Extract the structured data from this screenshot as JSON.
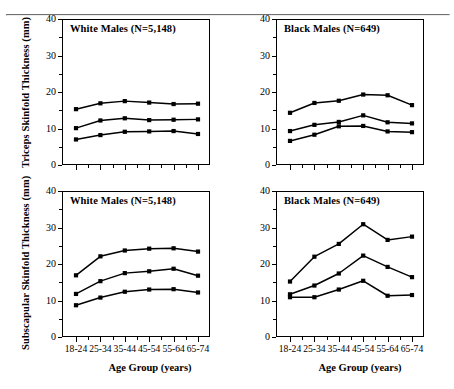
{
  "figure": {
    "xlabel": "Age Group (years)",
    "ylabel_top": "Triceps Skinfold Thickness (mm)",
    "ylabel_bottom": "Subscapular Skinfold Thickness (mm)",
    "panel_titles": {
      "white_males": "White Males (N=5,148)",
      "black_males": "Black Males (N=649)"
    },
    "ytick_labels": [
      "0",
      "10",
      "20",
      "30",
      "40"
    ],
    "xtick_labels": [
      "18-24",
      "25-34",
      "35-44",
      "45-54",
      "55-64",
      "65-74"
    ],
    "line_color": "#000000",
    "marker": "filled-square"
  },
  "chart_data": [
    {
      "type": "line",
      "title": "White Males (N=5,148)",
      "xlabel": "Age Group (years)",
      "ylabel": "Triceps Skinfold Thickness (mm)",
      "categories": [
        "18-24",
        "25-34",
        "35-44",
        "45-54",
        "55-64",
        "65-74"
      ],
      "ylim": [
        0,
        40
      ],
      "yticks": [
        0,
        10,
        20,
        30,
        40
      ],
      "grid": false,
      "legend": "none",
      "series": [
        {
          "name": "85th percentile",
          "values": [
            15.3,
            16.9,
            17.5,
            17.1,
            16.7,
            16.8
          ]
        },
        {
          "name": "50th percentile",
          "values": [
            10.1,
            12.2,
            12.8,
            12.3,
            12.4,
            12.5
          ]
        },
        {
          "name": "15th percentile",
          "values": [
            7.0,
            8.2,
            9.1,
            9.2,
            9.3,
            8.5
          ]
        }
      ]
    },
    {
      "type": "line",
      "title": "Black Males (N=649)",
      "xlabel": "Age Group (years)",
      "ylabel": "Triceps Skinfold Thickness (mm)",
      "categories": [
        "18-24",
        "25-34",
        "35-44",
        "45-54",
        "55-64",
        "65-74"
      ],
      "ylim": [
        0,
        40
      ],
      "yticks": [
        0,
        10,
        20,
        30,
        40
      ],
      "grid": false,
      "legend": "none",
      "series": [
        {
          "name": "85th percentile",
          "values": [
            14.3,
            17.0,
            17.6,
            19.3,
            19.1,
            16.4
          ]
        },
        {
          "name": "50th percentile",
          "values": [
            9.3,
            11.0,
            11.8,
            13.6,
            11.7,
            11.4
          ]
        },
        {
          "name": "15th percentile",
          "values": [
            6.6,
            8.3,
            10.6,
            10.7,
            9.2,
            9.0
          ]
        }
      ]
    },
    {
      "type": "line",
      "title": "White Males (N=5,148)",
      "xlabel": "Age Group (years)",
      "ylabel": "Subscapular Skinfold Thickness (mm)",
      "categories": [
        "18-24",
        "25-34",
        "35-44",
        "45-54",
        "55-64",
        "65-74"
      ],
      "ylim": [
        0,
        40
      ],
      "yticks": [
        0,
        10,
        20,
        30,
        40
      ],
      "grid": false,
      "legend": "none",
      "series": [
        {
          "name": "85th percentile",
          "values": [
            16.9,
            22.1,
            23.7,
            24.2,
            24.3,
            23.4
          ]
        },
        {
          "name": "50th percentile",
          "values": [
            11.8,
            15.3,
            17.5,
            18.0,
            18.7,
            16.8
          ]
        },
        {
          "name": "15th percentile",
          "values": [
            8.7,
            10.8,
            12.4,
            13.0,
            13.1,
            12.2
          ]
        }
      ]
    },
    {
      "type": "line",
      "title": "Black Males (N=649)",
      "xlabel": "Age Group (years)",
      "ylabel": "Subscapular Skinfold Thickness (mm)",
      "categories": [
        "18-24",
        "25-34",
        "35-44",
        "45-54",
        "55-64",
        "65-74"
      ],
      "ylim": [
        0,
        40
      ],
      "yticks": [
        0,
        10,
        20,
        30,
        40
      ],
      "grid": false,
      "legend": "none",
      "series": [
        {
          "name": "85th percentile",
          "values": [
            15.2,
            22.0,
            25.5,
            30.9,
            26.6,
            27.5
          ]
        },
        {
          "name": "50th percentile",
          "values": [
            11.7,
            14.1,
            17.4,
            22.3,
            19.2,
            16.4
          ]
        },
        {
          "name": "15th percentile",
          "values": [
            10.9,
            10.9,
            13.0,
            15.4,
            11.3,
            11.5
          ]
        }
      ]
    }
  ]
}
